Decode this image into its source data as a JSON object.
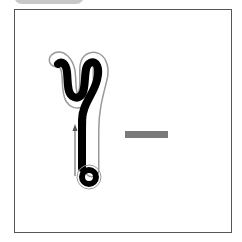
{
  "canvas": {
    "width": 242,
    "height": 242,
    "background": "#ffffff"
  },
  "frame": {
    "border_color": "#555555"
  },
  "top_tab": {
    "color": "#c8c8c8"
  },
  "glyph": {
    "description": "thick black stroke character: top hook, long vertical stem, closed loop at bottom",
    "stroke_color": "#000000",
    "outline_color": "#9a9a9a",
    "direction_arrow": "up"
  },
  "dash": {
    "color": "#7a7a7a"
  }
}
